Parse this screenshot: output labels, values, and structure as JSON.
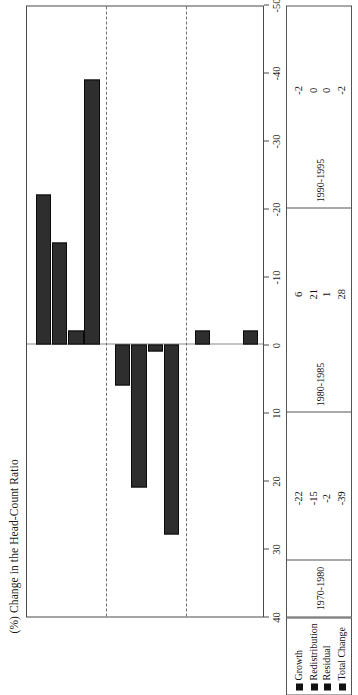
{
  "chart_data": {
    "type": "bar",
    "title": "(%) Change in the Head-Count Ratio",
    "orientation": "horizontal",
    "xlabel": "",
    "ylabel": "",
    "xlim": [
      40,
      -50
    ],
    "grid": false,
    "legend_position": "bottom-left",
    "categories": [
      "1970-1980",
      "1980-1985",
      "1990-1995"
    ],
    "series": [
      {
        "name": "Growth",
        "values": [
          -22,
          6,
          -2
        ]
      },
      {
        "name": "Redistribution",
        "values": [
          -15,
          21,
          0
        ]
      },
      {
        "name": "Residual",
        "values": [
          -2,
          1,
          0
        ]
      },
      {
        "name": "Total Change",
        "values": [
          -39,
          28,
          -2
        ]
      }
    ],
    "tick_labels": [
      "40",
      "30",
      "20",
      "10",
      "0",
      "-10",
      "-20",
      "-30",
      "-40",
      "-50"
    ],
    "tick_values": [
      40,
      30,
      20,
      10,
      0,
      -10,
      -20,
      -30,
      -40,
      -50
    ],
    "bar_color": "#2e2e2e",
    "bar_edge_color": "#0a0a0a"
  },
  "table": {
    "row_labels": [
      "Growth",
      "Redistribution",
      "Residual",
      "Total Change"
    ],
    "columns": [
      "1970-1980",
      "1980-1985",
      "1990-1995"
    ],
    "cells": [
      [
        "-22",
        "6",
        "-2"
      ],
      [
        "-15",
        "21",
        "0"
      ],
      [
        "-2",
        "1",
        "0"
      ],
      [
        "-39",
        "28",
        "-2"
      ]
    ]
  },
  "legend": {
    "items": [
      {
        "label": "Growth",
        "color": "#111111"
      },
      {
        "label": "Redistribution",
        "color": "#111111"
      },
      {
        "label": "Residual",
        "color": "#111111"
      },
      {
        "label": "Total Change",
        "color": "#111111"
      }
    ]
  }
}
